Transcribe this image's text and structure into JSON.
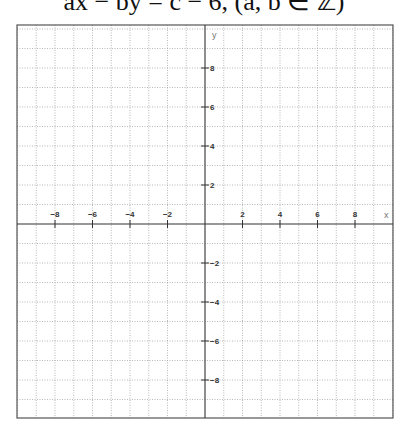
{
  "header": {
    "text": "ax − by = c − 6, (a, b ∈ ℤ)"
  },
  "colors": {
    "frame": "#555555",
    "axis": "#333333",
    "grid": "#9a9a9a",
    "tick_label": "#333333",
    "axis_name": "#777777"
  },
  "chart_data": {
    "type": "scatter",
    "title": "",
    "xlabel": "x",
    "ylabel": "y",
    "xlim": [
      -10,
      10
    ],
    "ylim": [
      -10,
      10
    ],
    "grid": true,
    "grid_step": 1,
    "grid_style": "dotted",
    "x_ticks": [
      -8,
      -6,
      -4,
      -2,
      2,
      4,
      6,
      8
    ],
    "y_ticks": [
      8,
      6,
      4,
      2,
      -2,
      -4,
      -6,
      -8
    ],
    "x_tick_labels": [
      "−8",
      "−6",
      "−4",
      "−2",
      "2",
      "4",
      "6",
      "8"
    ],
    "y_tick_labels": [
      "8",
      "6",
      "4",
      "2",
      "−2",
      "−4",
      "−6",
      "−8"
    ],
    "series": [],
    "legend": null
  },
  "layout": {
    "frame": {
      "left": 17,
      "top": 25,
      "right": 393,
      "bottom": 418
    },
    "origin": {
      "x": 205,
      "y": 224
    },
    "unit_px": {
      "x": 18.75,
      "y": 19.5
    }
  }
}
